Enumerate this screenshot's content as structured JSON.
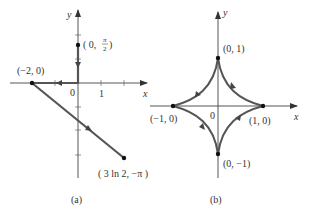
{
  "figure": {
    "panels": [
      {
        "id": "a",
        "caption": "(a)",
        "axes": {
          "x_label": "x",
          "y_label": "y"
        },
        "origin_label": "0",
        "x_tick_labels": [
          "1"
        ],
        "points": [
          {
            "label_pre": "( 0, ",
            "label_frac_num": "π",
            "label_frac_den": "2",
            "label_post": ")",
            "x": 0,
            "y": 1.5708
          },
          {
            "label": "(−2, 0)",
            "x": -2,
            "y": 0
          },
          {
            "label": "( 3 ln 2, −π )",
            "x": 2.0794,
            "y": -3.1416
          }
        ],
        "path_description": "From (0, π/2) down the y-axis to origin, then left along x-axis to (−2, 0), then diagonally to (3 ln 2, −π)"
      },
      {
        "id": "b",
        "caption": "(b)",
        "axes": {
          "x_label": "x",
          "y_label": "y"
        },
        "origin_label": "0",
        "points": [
          {
            "label": "(0, 1)",
            "x": 0,
            "y": 1
          },
          {
            "label": "(−1, 0)",
            "x": -1,
            "y": 0
          },
          {
            "label": "(1, 0)",
            "x": 1,
            "y": 0
          },
          {
            "label": "(0, −1)",
            "x": 0,
            "y": -1
          }
        ],
        "curve": "astroid",
        "orientation": "counterclockwise"
      }
    ],
    "colors": {
      "curve": "#555555",
      "axis": "#444444",
      "text": "#333333",
      "background": "#ffffff"
    }
  }
}
